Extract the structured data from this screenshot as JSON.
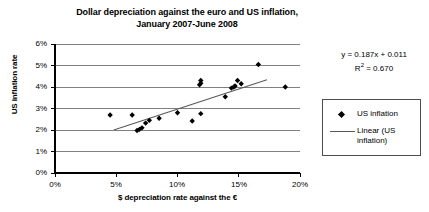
{
  "chart_data": {
    "type": "scatter",
    "title": "Dollar depreciation against the euro and US inflation, January 2007-June 2008",
    "title_lines": [
      "Dollar depreciation against the euro and US inflation,",
      "January 2007-June 2008"
    ],
    "xlabel": "$ depreciation rate against the €",
    "ylabel": "US inflation rate",
    "xlim": [
      0,
      20
    ],
    "ylim": [
      0,
      6
    ],
    "xticks": [
      0,
      5,
      10,
      15,
      20
    ],
    "yticks": [
      0,
      1,
      2,
      3,
      4,
      5,
      6
    ],
    "xtick_labels": [
      "0%",
      "5%",
      "10%",
      "15%",
      "20%"
    ],
    "ytick_labels": [
      "0%",
      "1%",
      "2%",
      "3%",
      "4%",
      "5%",
      "6%"
    ],
    "grid": "horizontal",
    "legend_position": "right",
    "series": [
      {
        "name": "US inflation",
        "type": "scatter",
        "marker": "diamond",
        "color": "#000000",
        "points": [
          [
            4.5,
            2.7
          ],
          [
            6.3,
            2.7
          ],
          [
            6.7,
            1.98
          ],
          [
            6.9,
            2.03
          ],
          [
            7.1,
            2.1
          ],
          [
            7.4,
            2.32
          ],
          [
            7.7,
            2.45
          ],
          [
            8.5,
            2.55
          ],
          [
            10.0,
            2.8
          ],
          [
            11.2,
            2.42
          ],
          [
            11.9,
            2.76
          ],
          [
            11.8,
            4.1
          ],
          [
            11.9,
            4.18
          ],
          [
            11.9,
            4.3
          ],
          [
            13.9,
            3.55
          ],
          [
            14.4,
            3.95
          ],
          [
            14.6,
            4.0
          ],
          [
            14.7,
            4.05
          ],
          [
            14.9,
            4.3
          ],
          [
            15.2,
            4.15
          ],
          [
            16.6,
            5.05
          ],
          [
            18.8,
            4.0
          ]
        ]
      },
      {
        "name": "Linear (US inflation)",
        "type": "line",
        "color": "#595959",
        "fit": "linear",
        "slope": 0.187,
        "intercept": 0.011,
        "r_squared": 0.67,
        "x_range": [
          4.8,
          17.3
        ]
      }
    ],
    "annotations": {
      "equation": "y = 0.187x + 0.011",
      "r_squared_label": "R",
      "r_squared_exponent": "2",
      "r_squared_value": " = 0.670"
    }
  },
  "legend": {
    "entries": [
      {
        "label": "US inflation",
        "marker": "diamond"
      },
      {
        "label": "Linear (US\ninflation)",
        "marker": "line"
      }
    ]
  }
}
